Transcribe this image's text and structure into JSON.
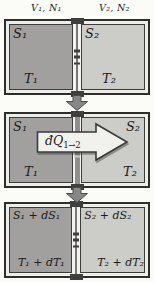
{
  "colors": {
    "background": "#fbfbf8",
    "frame_border": "#2d2d2b",
    "frame_gap": "#ededea",
    "left_box": "#a1a09e",
    "right_box": "#ccccc8",
    "box_border": "#3c3c3a",
    "partition_bg": "#f3f3f0",
    "partition_line": "#777775",
    "hatch": "#3e3e3c",
    "connector": "#3e3e3c",
    "step_arrow_fill": "#878785",
    "step_arrow_stroke": "#4a4a48",
    "heat_arrow_fill": "#f1f1ee",
    "heat_arrow_stroke": "#3a3a38",
    "text": "#1b1b1b"
  },
  "top_labels": {
    "left": "V₁, N₁",
    "right": "V₂, N₂"
  },
  "panels": [
    {
      "left": {
        "entropy": "S₁",
        "temperature": "T₁"
      },
      "right": {
        "entropy": "S₂",
        "temperature": "T₂"
      }
    },
    {
      "left": {
        "entropy": "S₁",
        "temperature": "T₁"
      },
      "right": {
        "entropy": "S₂",
        "temperature": "T₂"
      },
      "heat_arrow": {
        "base": "đQ",
        "subscript": "1→2"
      }
    },
    {
      "left": {
        "entropy": "S₁ + dS₁",
        "temperature": "T₁ + dT₁"
      },
      "right": {
        "entropy": "S₂ + dS₂",
        "temperature": "T₂ + dT₂"
      }
    }
  ],
  "icons": {
    "step_arrow": "down-arrow",
    "heat_arrow": "right-arrow",
    "partition": "hatched-diathermal-wall"
  }
}
